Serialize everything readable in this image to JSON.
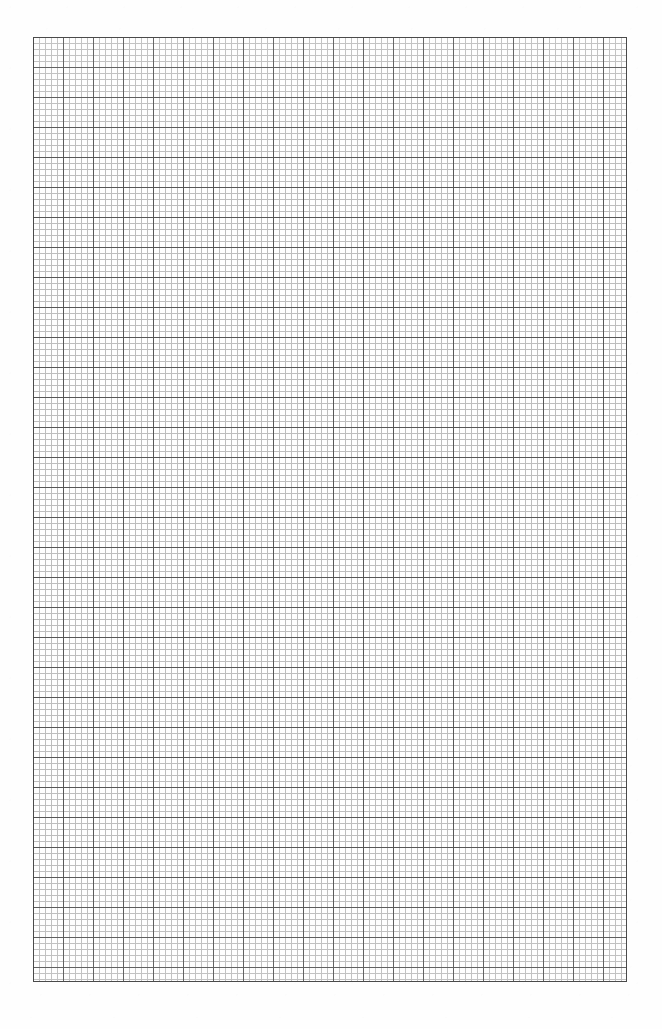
{
  "document": {
    "type": "graph-paper",
    "title": "Blank quadrille graph paper sheet",
    "page_background": "#ffffff",
    "paper_background": "#fefefe",
    "page_width_px": 662,
    "page_height_px": 1029,
    "has_text": false,
    "has_header": false,
    "has_footer": false,
    "visible_text": ""
  },
  "grid": {
    "name": "ruled-grid",
    "left_px": 33,
    "top_px": 37,
    "width_px": 594,
    "height_px": 945,
    "minor_cell_px": 6,
    "major_every_n_cells": 5,
    "major_cell_px": 30,
    "minor_line_color": "#bdbdbd",
    "major_line_color": "#565656",
    "border_color": "#4a4a4a",
    "minor_line_width_px": 1,
    "major_line_width_px": 1,
    "border_width_px": 1,
    "minor_columns": 99,
    "minor_rows": 157,
    "major_columns": 19,
    "major_rows": 31
  },
  "margins": {
    "left_px": 33,
    "right_px": 35,
    "top_px": 37,
    "bottom_px": 47,
    "color": "#ffffff"
  },
  "chart_data": {
    "type": "table",
    "title": "",
    "xlabel": "",
    "ylabel": "",
    "categories": [],
    "values": []
  }
}
